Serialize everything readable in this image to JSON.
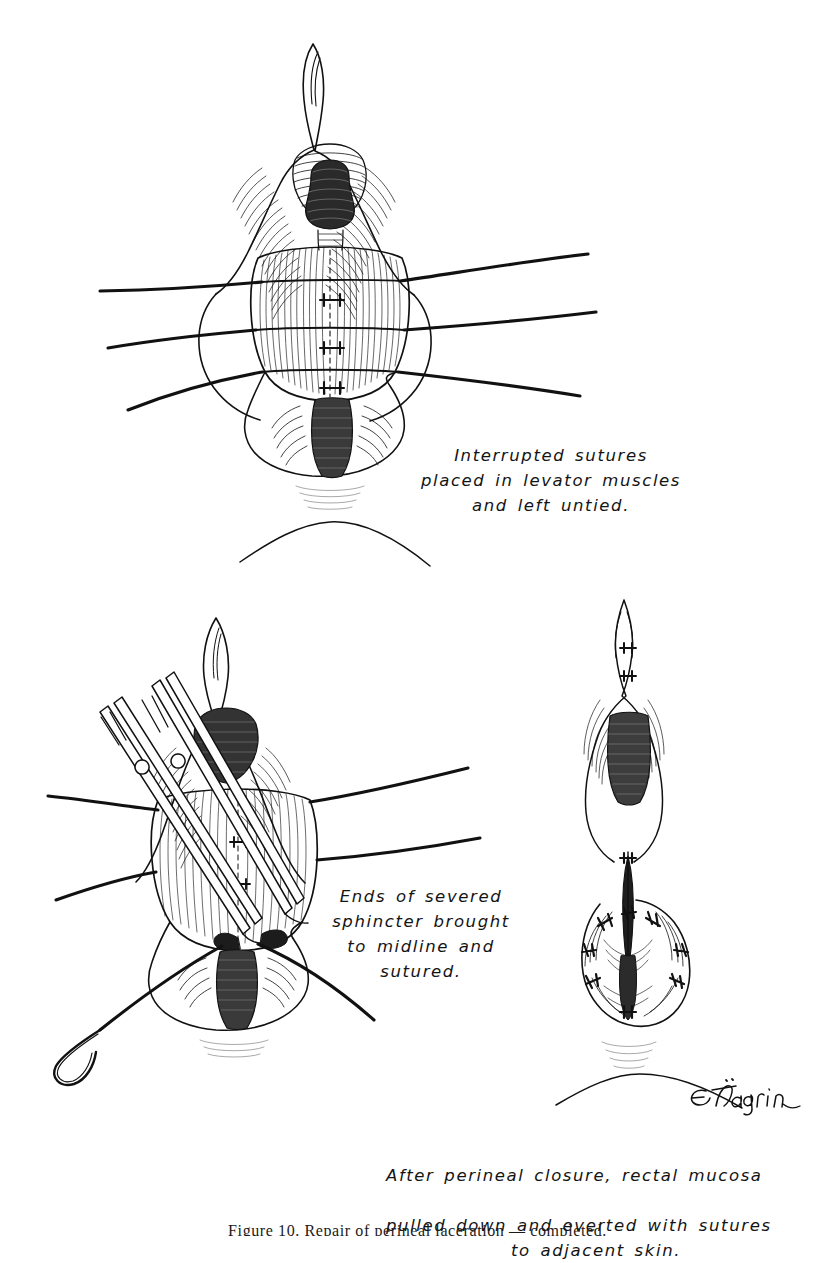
{
  "plate": {
    "medium": "pen-and-ink line drawing",
    "background_color": "#ffffff",
    "ink_color": "#111111",
    "artist_signature": "E.Tagrin"
  },
  "panels": [
    {
      "id": "panel-top",
      "caption": "Interrupted sutures\nplaced in levator muscles\nand left untied.",
      "suture_strand_count": 3,
      "stitch_mark_count": 3
    },
    {
      "id": "panel-lower-left",
      "caption": "Ends of severed\nsphincter brought\nto midline and\nsutured.",
      "instruments": "two hemostat forceps",
      "suture_strand_count": 5,
      "needle": "curved surgical needle"
    },
    {
      "id": "panel-lower-right",
      "caption_line_1": "After perineal closure, rectal mucosa",
      "caption_line_2": "pulled down and everted with sutures",
      "caption_line_3": "to adjacent skin.",
      "knot_count": 8
    }
  ],
  "footer": {
    "text": "Figure 10. Repair of perineal laceration — completed."
  }
}
